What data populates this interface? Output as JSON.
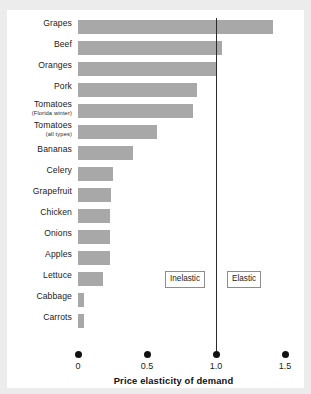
{
  "chart_data": {
    "type": "bar",
    "orientation": "horizontal",
    "title": "",
    "xlabel": "Price elasticity of demand",
    "ylabel": "",
    "xlim": [
      0,
      1.5
    ],
    "ylim": null,
    "grid": false,
    "legend": null,
    "xticks": [
      {
        "value": 0,
        "label": "0"
      },
      {
        "value": 0.5,
        "label": "0.5"
      },
      {
        "value": 1.0,
        "label": "1.0"
      },
      {
        "value": 1.5,
        "label": "1.5"
      }
    ],
    "categories": [
      "Grapes",
      "Beef",
      "Oranges",
      "Tomatoes (Florida winter)",
      "Pork",
      "Tomatoes (all types)",
      "Bananas",
      "Celery",
      "Grapefruit",
      "Chicken",
      "Onions",
      "Apples",
      "Lettuce",
      "Cabbage",
      "Carrots"
    ],
    "values": [
      1.41,
      1.04,
      1.0,
      0.86,
      0.83,
      0.57,
      0.4,
      0.25,
      0.24,
      0.23,
      0.23,
      0.23,
      0.18,
      0.04,
      0.04
    ],
    "bars": [
      {
        "label": "Grapes",
        "sublabel": "",
        "value": 1.41
      },
      {
        "label": "Beef",
        "sublabel": "",
        "value": 1.04
      },
      {
        "label": "Oranges",
        "sublabel": "",
        "value": 1.0
      },
      {
        "label": "Pork",
        "sublabel": "",
        "value": 0.86
      },
      {
        "label": "Tomatoes",
        "sublabel": "(Florida winter)",
        "value": 0.83
      },
      {
        "label": "Tomatoes",
        "sublabel": "(all types)",
        "value": 0.57
      },
      {
        "label": "Bananas",
        "sublabel": "",
        "value": 0.4
      },
      {
        "label": "Celery",
        "sublabel": "",
        "value": 0.25
      },
      {
        "label": "Grapefruit",
        "sublabel": "",
        "value": 0.24
      },
      {
        "label": "Chicken",
        "sublabel": "",
        "value": 0.23
      },
      {
        "label": "Onions",
        "sublabel": "",
        "value": 0.23
      },
      {
        "label": "Apples",
        "sublabel": "",
        "value": 0.23
      },
      {
        "label": "Lettuce",
        "sublabel": "",
        "value": 0.18
      },
      {
        "label": "Cabbage",
        "sublabel": "",
        "value": 0.04
      },
      {
        "label": "Carrots",
        "sublabel": "",
        "value": 0.04
      }
    ],
    "annotations": [
      {
        "name": "unit-elastic-line",
        "type": "vline",
        "value": 1.0
      },
      {
        "name": "inelastic-region",
        "type": "box",
        "text": "Inelastic",
        "at": 0.63
      },
      {
        "name": "elastic-region",
        "type": "box",
        "text": "Elastic",
        "at": 1.08
      }
    ],
    "colors": {
      "bar": "#a8a8a8",
      "unit_line": "#2b2b2b",
      "text": "#1b1b1b",
      "panel": "#ffffff",
      "mat": "#ececed"
    }
  },
  "regions": {
    "inelastic_label": "Inelastic",
    "elastic_label": "Elastic"
  },
  "axis": {
    "title": "Price elasticity of demand"
  }
}
